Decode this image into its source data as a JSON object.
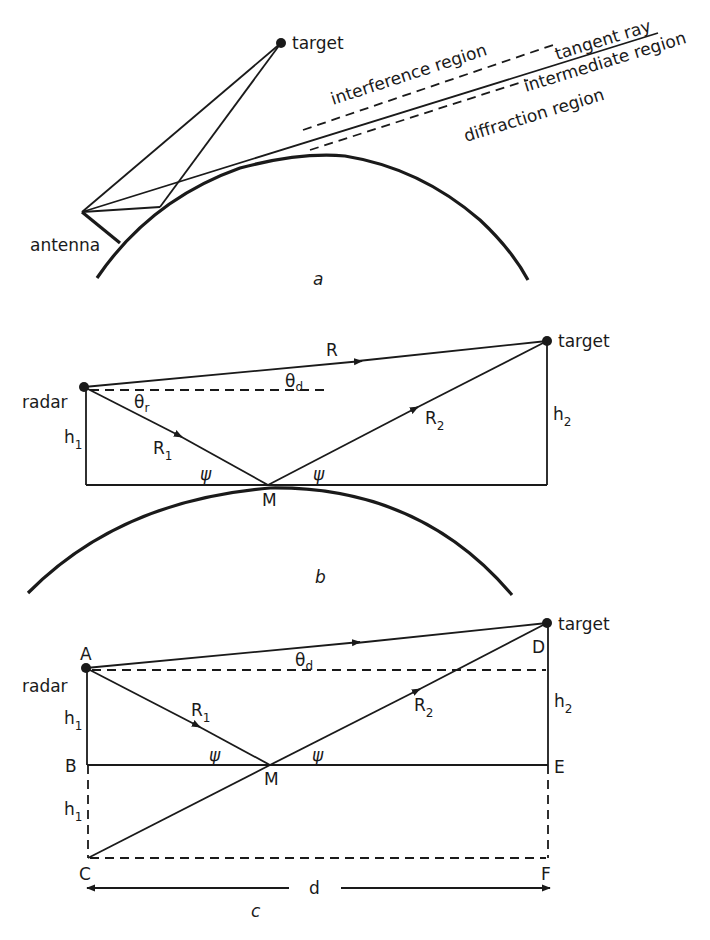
{
  "figure": {
    "panels": [
      {
        "id": "a",
        "caption": "a",
        "labels": {
          "target": "target",
          "antenna": "antenna",
          "interference": "interference region",
          "tangent": "tangent ray",
          "intermediate": "intermediate region",
          "diffraction": "diffraction region"
        }
      },
      {
        "id": "b",
        "caption": "b",
        "labels": {
          "target": "target",
          "radar": "radar",
          "R": "R",
          "theta_d": "θ",
          "theta_d_sub": "d",
          "theta_r": "θ",
          "theta_r_sub": "r",
          "h1": "h",
          "h1_sub": "1",
          "h2": "h",
          "h2_sub": "2",
          "R1": "R",
          "R1_sub": "1",
          "R2": "R",
          "R2_sub": "2",
          "psi_left": "ψ",
          "psi_right": "ψ",
          "M": "M"
        }
      },
      {
        "id": "c",
        "caption": "c",
        "labels": {
          "target": "target",
          "radar": "radar",
          "A": "A",
          "B": "B",
          "C": "C",
          "D": "D",
          "E": "E",
          "F": "F",
          "M": "M",
          "theta_d": "θ",
          "theta_d_sub": "d",
          "h1_top": "h",
          "h1_top_sub": "1",
          "h1_bottom": "h",
          "h1_bottom_sub": "1",
          "h2": "h",
          "h2_sub": "2",
          "R1": "R",
          "R1_sub": "1",
          "R2": "R",
          "R2_sub": "2",
          "psi_left": "ψ",
          "psi_right": "ψ",
          "d": "d"
        }
      }
    ]
  }
}
